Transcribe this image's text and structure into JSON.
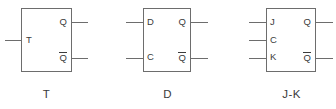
{
  "diagram": {
    "stroke_color": "#6d6d6d",
    "text_color": "#3b3b3b",
    "background_color": "#ffffff",
    "flipflops": [
      {
        "id": "t-flip-flop",
        "caption": "T",
        "inputs": [
          {
            "label": "T",
            "name": "t-input"
          }
        ],
        "outputs": [
          {
            "label": "Q",
            "overbar": false,
            "name": "q-output"
          },
          {
            "label": "Q",
            "overbar": true,
            "name": "q-not-output"
          }
        ]
      },
      {
        "id": "d-flip-flop",
        "caption": "D",
        "inputs": [
          {
            "label": "D",
            "name": "d-input"
          },
          {
            "label": "C",
            "name": "c-input"
          }
        ],
        "outputs": [
          {
            "label": "Q",
            "overbar": false,
            "name": "q-output"
          },
          {
            "label": "Q",
            "overbar": true,
            "name": "q-not-output"
          }
        ]
      },
      {
        "id": "jk-flip-flop",
        "caption": "J-K",
        "inputs": [
          {
            "label": "J",
            "name": "j-input"
          },
          {
            "label": "C",
            "name": "c-input"
          },
          {
            "label": "K",
            "name": "k-input"
          }
        ],
        "outputs": [
          {
            "label": "Q",
            "overbar": false,
            "name": "q-output"
          },
          {
            "label": "Q",
            "overbar": true,
            "name": "q-not-output"
          }
        ]
      }
    ]
  }
}
